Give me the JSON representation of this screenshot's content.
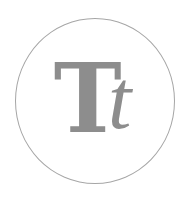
{
  "icon": {
    "name": "text-format-icon",
    "uppercase": "T",
    "lowercase": "t",
    "colors": {
      "glyph": "#8d8d8d",
      "circle": "#a6a6a6",
      "background": "#ffffff"
    }
  }
}
